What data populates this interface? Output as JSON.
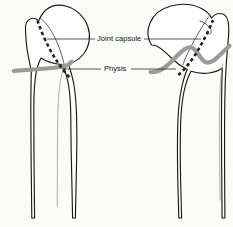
{
  "figure": {
    "background_color": "#fbfbfa",
    "labels": {
      "joint_capsule": "Joint capsule",
      "physis": "Physis"
    },
    "colors": {
      "outline": "#1a1a1a",
      "physis_gray": "#9b9b9b",
      "capsule_dash": "#232323",
      "leader": "#2b2b2b",
      "bone_fill": "#ffffff",
      "text": "#141414"
    },
    "panels": [
      {
        "id": "left-panel",
        "name": "child-proximal-femur",
        "side": "left",
        "has_joint_capsule_dashed_line": true,
        "has_physis_line": true,
        "physis_shape": "nearly-straight-transverse",
        "capsule_direction": "superolateral-to-inferomedial"
      },
      {
        "id": "right-panel",
        "name": "adult-proximal-femur",
        "side": "right",
        "has_joint_capsule_dashed_line": true,
        "has_physis_line": true,
        "physis_shape": "undulating-wavy",
        "capsule_direction": "superomedial-to-inferolateral"
      }
    ],
    "annotations": [
      {
        "id": "joint-capsule-annotation",
        "label_key": "joint_capsule",
        "text_x": 97,
        "text_y": 39,
        "leader_left_from_x": 95,
        "leader_left_to_x": 47,
        "leader_right_from_x": 144,
        "leader_right_to_x": 201,
        "leader_y": 39
      },
      {
        "id": "physis-annotation",
        "label_key": "physis",
        "text_x": 104,
        "text_y": 69,
        "leader_left_from_x": 101,
        "leader_left_to_x": 62,
        "leader_right_from_x": 131,
        "leader_right_to_x": 176,
        "leader_y": 69
      }
    ]
  }
}
